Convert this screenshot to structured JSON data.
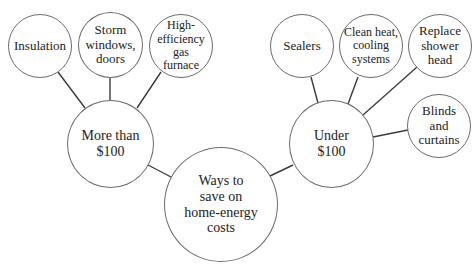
{
  "diagram": {
    "title": "Ways to save on home-energy costs",
    "root": {
      "id": "root",
      "label": "Ways to\nsave on\nhome-energy\ncosts"
    },
    "branches": [
      {
        "id": "more",
        "label": "More than\n$100",
        "children": [
          {
            "id": "insulation",
            "label": "Insulation"
          },
          {
            "id": "storm",
            "label": "Storm\nwindows,\ndoors"
          },
          {
            "id": "furnace",
            "label": "High-\nefficiency\ngas\nfurnace"
          }
        ]
      },
      {
        "id": "under",
        "label": "Under\n$100",
        "children": [
          {
            "id": "sealers",
            "label": "Sealers"
          },
          {
            "id": "clean",
            "label": "Clean heat,\ncooling\nsystems"
          },
          {
            "id": "shower",
            "label": "Replace\nshower\nhead"
          },
          {
            "id": "blinds",
            "label": "Blinds\nand\ncurtains"
          }
        ]
      }
    ]
  },
  "nodes": {
    "root": "Ways to\nsave on\nhome-energy\ncosts",
    "more": "More than\n$100",
    "under": "Under\n$100",
    "insulation": "Insulation",
    "storm": "Storm\nwindows,\ndoors",
    "furnace": "High-\nefficiency\ngas\nfurnace",
    "sealers": "Sealers",
    "clean": "Clean heat,\ncooling\nsystems",
    "shower": "Replace\nshower\nhead",
    "blinds": "Blinds\nand\ncurtains"
  },
  "colors": {
    "line": "#3a3a3a",
    "circle_border": "#6b6b6b",
    "text": "#222222",
    "background": "#ffffff"
  }
}
